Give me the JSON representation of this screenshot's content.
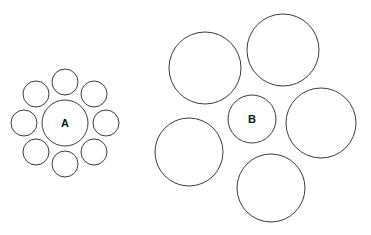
{
  "figure": {
    "width": 371,
    "height": 235,
    "background_color": "#ffffff",
    "stroke_color": "#3b3b3b",
    "fill_color": "#ffffff",
    "stroke_width": 1,
    "label_color": "#111111"
  },
  "chart_data": {
    "type": "scatter",
    "xlabel": "",
    "ylabel": "",
    "xlim": [
      0,
      371
    ],
    "ylim": [
      0,
      235
    ],
    "grid": false,
    "legend": "none",
    "annotations": [
      "A",
      "B"
    ],
    "groups": [
      {
        "name": "left-cluster",
        "center_label": "A",
        "center": {
          "cx": 65,
          "cy": 123,
          "r": 23
        },
        "surround_count": 8,
        "surround_radius": 13,
        "surround_ring_distance": 41,
        "surrounds": [
          {
            "cx": 65,
            "cy": 82,
            "r": 13
          },
          {
            "cx": 94,
            "cy": 94,
            "r": 13
          },
          {
            "cx": 106,
            "cy": 123,
            "r": 13
          },
          {
            "cx": 94,
            "cy": 152,
            "r": 13
          },
          {
            "cx": 65,
            "cy": 164,
            "r": 13
          },
          {
            "cx": 36,
            "cy": 152,
            "r": 13
          },
          {
            "cx": 24,
            "cy": 123,
            "r": 13
          },
          {
            "cx": 36,
            "cy": 94,
            "r": 13
          }
        ]
      },
      {
        "name": "right-cluster",
        "center_label": "B",
        "center": {
          "cx": 252,
          "cy": 119,
          "r": 24
        },
        "surround_count": 5,
        "surround_radius": 35,
        "surrounds": [
          {
            "cx": 205,
            "cy": 68,
            "r": 36
          },
          {
            "cx": 283,
            "cy": 50,
            "r": 36
          },
          {
            "cx": 321,
            "cy": 123,
            "r": 35
          },
          {
            "cx": 271,
            "cy": 188,
            "r": 34
          },
          {
            "cx": 189,
            "cy": 152,
            "r": 34
          }
        ]
      }
    ]
  }
}
